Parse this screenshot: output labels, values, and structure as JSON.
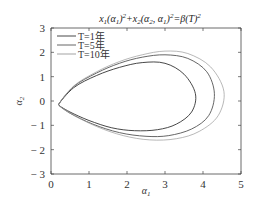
{
  "chart_data": {
    "type": "line",
    "xlabel": "α1",
    "ylabel": "α2",
    "xlim": [
      0,
      5
    ],
    "ylim": [
      -3,
      3
    ],
    "xticks": [
      0,
      1,
      2,
      3,
      4,
      5
    ],
    "yticks": [
      3,
      2,
      1,
      0,
      -1,
      -2,
      -3
    ],
    "grid": false,
    "legend_position": "upper left",
    "series": [
      {
        "name": "T=1年",
        "color": "#333333",
        "description": "closed teardrop contour",
        "x": [
          0.2,
          0.6,
          1.2,
          1.8,
          2.4,
          3.0,
          3.5,
          3.8,
          3.7,
          3.3,
          2.8,
          2.2,
          1.6,
          1.0,
          0.5,
          0.2
        ],
        "y": [
          -0.15,
          0.55,
          1.05,
          1.38,
          1.58,
          1.55,
          1.1,
          0.3,
          -0.45,
          -0.95,
          -1.18,
          -1.22,
          -1.1,
          -0.8,
          -0.45,
          -0.15
        ]
      },
      {
        "name": "T=5年",
        "color": "#555555",
        "description": "closed teardrop contour",
        "x": [
          0.2,
          0.6,
          1.2,
          1.8,
          2.4,
          3.0,
          3.6,
          4.1,
          4.3,
          4.15,
          3.7,
          3.1,
          2.5,
          1.8,
          1.1,
          0.5,
          0.2
        ],
        "y": [
          -0.15,
          0.6,
          1.15,
          1.55,
          1.8,
          1.9,
          1.75,
          1.2,
          0.3,
          -0.6,
          -1.15,
          -1.42,
          -1.45,
          -1.3,
          -0.95,
          -0.5,
          -0.15
        ],
        "label": "T=5年"
      },
      {
        "name": "T=10年",
        "color": "#999999",
        "description": "closed teardrop contour",
        "x": [
          0.2,
          0.6,
          1.2,
          1.8,
          2.4,
          3.0,
          3.6,
          4.2,
          4.55,
          4.4,
          3.9,
          3.3,
          2.6,
          1.9,
          1.2,
          0.5,
          0.2
        ],
        "y": [
          -0.15,
          0.62,
          1.2,
          1.62,
          1.9,
          2.05,
          1.95,
          1.4,
          0.4,
          -0.6,
          -1.25,
          -1.55,
          -1.6,
          -1.42,
          -1.05,
          -0.5,
          -0.15
        ]
      }
    ]
  },
  "legend": {
    "items": [
      {
        "label": "T=1年",
        "color": "#333333"
      },
      {
        "label": "T=5年",
        "color": "#555555"
      },
      {
        "label": "T=10年",
        "color": "#999999"
      }
    ]
  },
  "axes": {
    "x_tick_labels": [
      "0",
      "1",
      "2",
      "3",
      "4",
      "5"
    ],
    "y_tick_labels": [
      "3",
      "2",
      "1",
      "0",
      "− 1",
      "− 2",
      "− 3"
    ],
    "x_label": "α1",
    "y_label": "α2"
  },
  "title": {
    "text": "x1(α1)²+x2(α2, α1)²=β(T)²"
  }
}
